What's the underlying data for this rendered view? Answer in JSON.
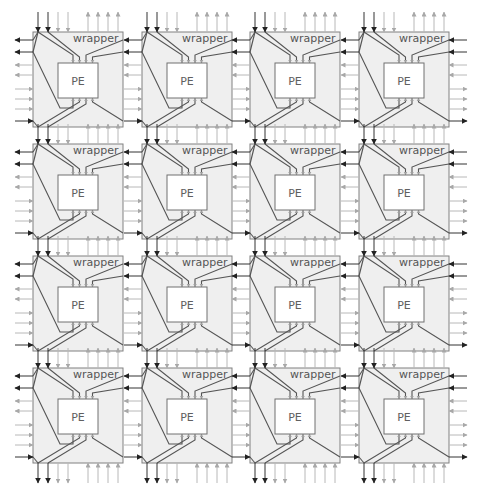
{
  "diagram": {
    "rows": 4,
    "cols": 4,
    "tile_origin": {
      "x": 33,
      "y": 32
    },
    "col_pitch": 108.5,
    "row_pitch": 112,
    "wrapper": {
      "width": 90,
      "height": 95,
      "label": "wrapper"
    },
    "pe": {
      "x": 25,
      "y": 31,
      "width": 40,
      "height": 35,
      "label": "PE"
    },
    "pin_offsets_x": [
      40,
      46.5,
      53,
      59.5
    ],
    "top_io": [
      {
        "x": 5,
        "dir": "down",
        "tone": "dark"
      },
      {
        "x": 15,
        "dir": "down",
        "tone": "dark"
      },
      {
        "x": 25,
        "dir": "down",
        "tone": "light"
      },
      {
        "x": 35,
        "dir": "down",
        "tone": "light"
      },
      {
        "x": 55,
        "dir": "up",
        "tone": "light"
      },
      {
        "x": 65,
        "dir": "up",
        "tone": "light"
      },
      {
        "x": 75,
        "dir": "up",
        "tone": "light"
      },
      {
        "x": 85,
        "dir": "up",
        "tone": "light"
      }
    ],
    "side_io": [
      {
        "y": 8,
        "dir": "left",
        "tone": "dark"
      },
      {
        "y": 20,
        "dir": "left",
        "tone": "dark"
      },
      {
        "y": 33,
        "dir": "left",
        "tone": "light"
      },
      {
        "y": 43,
        "dir": "left",
        "tone": "light"
      },
      {
        "y": 57,
        "dir": "right",
        "tone": "light"
      },
      {
        "y": 67,
        "dir": "right",
        "tone": "light"
      },
      {
        "y": 77,
        "dir": "right",
        "tone": "light"
      },
      {
        "y": 89,
        "dir": "right",
        "tone": "dark"
      }
    ],
    "colors": {
      "dark_arrow": "#222222",
      "light_arrow": "#a8a8a8",
      "wrapper_fill": "#efefef",
      "wrapper_stroke": "#808080",
      "pe_fill": "#ffffff",
      "wire": "#555555"
    }
  }
}
